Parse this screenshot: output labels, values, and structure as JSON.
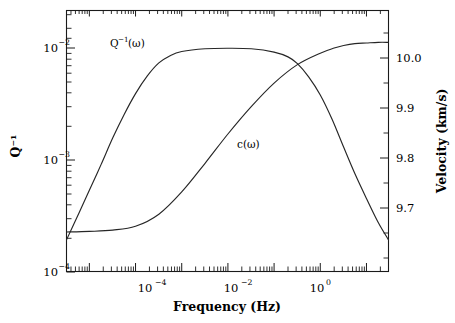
{
  "chart_data": {
    "type": "line",
    "title": "",
    "xlabel": "Frequency (Hz)",
    "ylabel": "Q⁻¹",
    "y2label": "Velocity (km/s)",
    "xscale": "log",
    "yscale": "log",
    "y2scale": "linear",
    "xlim": [
      3.2e-06,
      30.0
    ],
    "ylim": [
      0.0001,
      0.02
    ],
    "y2lim": [
      9.64,
      10.05
    ],
    "grid": false,
    "legend_position": "inline-annotations",
    "xticks": [
      {
        "value": 0.0001,
        "label_mantissa": "10",
        "label_exponent": "−4"
      },
      {
        "value": 0.01,
        "label_mantissa": "10",
        "label_exponent": "−2"
      },
      {
        "value": 1.0,
        "label_mantissa": "10",
        "label_exponent": "0"
      }
    ],
    "yticks": [
      {
        "value": 0.01,
        "label_mantissa": "10",
        "label_exponent": "−2"
      },
      {
        "value": 0.001,
        "label_mantissa": "10",
        "label_exponent": "−3"
      },
      {
        "value": 0.0001,
        "label_mantissa": "10",
        "label_exponent": "−4"
      }
    ],
    "y2ticks": [
      {
        "value": 10.0,
        "label": "10.0"
      },
      {
        "value": 9.9,
        "label": "9.9"
      },
      {
        "value": 9.8,
        "label": "9.8"
      },
      {
        "value": 9.7,
        "label": "9.7"
      }
    ],
    "series": [
      {
        "name": "Q-inverse",
        "axis": "left",
        "annotation": {
          "text_main": "Q",
          "text_sup": "−1",
          "text_tail": "(ω)",
          "x": 1.1e-05,
          "y": 0.0096
        },
        "x": [
          3.2e-06,
          6e-06,
          1e-05,
          1.8e-05,
          3.2e-05,
          5.6e-05,
          0.0001,
          0.00018,
          0.00032,
          0.00056,
          0.001,
          0.0032,
          0.01,
          0.032,
          0.1,
          0.2,
          0.32,
          0.56,
          1.0,
          1.8,
          3.2,
          5.6,
          10.0,
          18.0,
          30.0
        ],
        "y": [
          0.00019,
          0.00033,
          0.00052,
          0.00088,
          0.0015,
          0.0024,
          0.0037,
          0.0053,
          0.0069,
          0.008,
          0.0087,
          0.0092,
          0.0093,
          0.0092,
          0.0086,
          0.0078,
          0.0068,
          0.0052,
          0.0036,
          0.0022,
          0.00125,
          0.00073,
          0.00044,
          0.00027,
          0.00019
        ]
      },
      {
        "name": "phase-velocity",
        "axis": "right",
        "annotation": {
          "text_main": "c(ω)",
          "x": 0.011,
          "y2": 9.79
        },
        "x": [
          3.2e-06,
          1e-05,
          3.2e-05,
          0.0001,
          0.00032,
          0.001,
          0.0032,
          0.01,
          0.032,
          0.1,
          0.32,
          1.0,
          2.0,
          3.2,
          5.6,
          10.0,
          18.0,
          30.0
        ],
        "y2": [
          9.702,
          9.703,
          9.705,
          9.711,
          9.73,
          9.765,
          9.81,
          9.856,
          9.899,
          9.936,
          9.965,
          9.983,
          9.991,
          9.995,
          9.998,
          9.999,
          10.0,
          10.0
        ]
      }
    ]
  }
}
